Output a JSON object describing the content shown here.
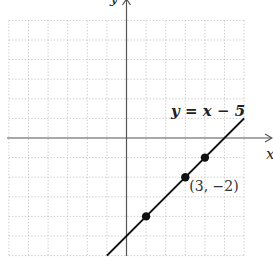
{
  "chart_data": {
    "type": "line",
    "title": "",
    "xlabel": "x",
    "ylabel": "y",
    "xlim": [
      -6,
      6
    ],
    "ylim": [
      -6,
      6
    ],
    "grid": true,
    "grid_step": 1,
    "series": [
      {
        "name": "y = x − 5",
        "equation": {
          "slope": 1,
          "intercept": -5
        },
        "segment_x": [
          -1,
          6
        ]
      }
    ],
    "points": [
      {
        "x": 1,
        "y": -4,
        "label": ""
      },
      {
        "x": 3,
        "y": -2,
        "label": "(3, −2)"
      },
      {
        "x": 4,
        "y": -1,
        "label": ""
      }
    ],
    "annotations": [
      {
        "text": "y = x − 5",
        "position": "upper-right near line"
      }
    ],
    "colors": {
      "line": "#111111",
      "axis": "#555555",
      "grid": "#b8b8b8"
    }
  }
}
